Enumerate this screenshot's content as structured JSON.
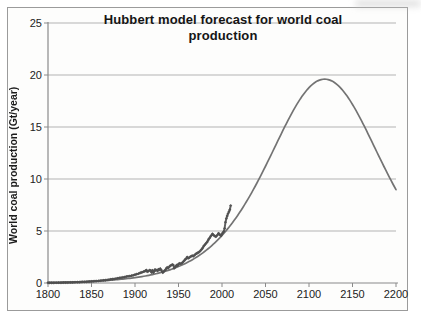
{
  "chart_data": {
    "type": "line",
    "title": "Hubbert model forecast for world coal production",
    "ylabel": "World coal production (Gt/year)",
    "xlabel": "",
    "xlim": [
      1800,
      2200
    ],
    "ylim": [
      0,
      25
    ],
    "x_ticks": [
      1800,
      1850,
      1900,
      1950,
      2000,
      2050,
      2100,
      2150,
      2200
    ],
    "y_ticks": [
      0,
      5,
      10,
      15,
      20,
      25
    ],
    "grid": "horizontal",
    "legend": "none",
    "colors": {
      "model_curve": "#6b6b6b",
      "historical_data": "#565656",
      "historical_marker": "#4e4e4e",
      "gridline": "#b3b3b3",
      "axis": "#8a8a8a",
      "text": "#1b1b1b",
      "frame_border": "#9b9b9b",
      "background": "#fdfdfc"
    },
    "series": [
      {
        "name": "Hubbert model forecast",
        "type": "smooth-line",
        "color_key": "model_curve",
        "model_params": {
          "formula": "P(t) = Pmax / cosh^2((t - peak_year) / width_years)",
          "Pmax_gt_per_year": 19.6,
          "peak_year": 2118,
          "width_years": 87
        },
        "sampled_points": [
          [
            1800,
            0.05
          ],
          [
            1810,
            0.07
          ],
          [
            1820,
            0.08
          ],
          [
            1830,
            0.1
          ],
          [
            1840,
            0.13
          ],
          [
            1850,
            0.17
          ],
          [
            1860,
            0.21
          ],
          [
            1870,
            0.26
          ],
          [
            1880,
            0.33
          ],
          [
            1890,
            0.41
          ],
          [
            1900,
            0.52
          ],
          [
            1910,
            0.65
          ],
          [
            1920,
            0.81
          ],
          [
            1930,
            1.01
          ],
          [
            1940,
            1.27
          ],
          [
            1950,
            1.58
          ],
          [
            1960,
            1.97
          ],
          [
            1970,
            2.45
          ],
          [
            1980,
            3.03
          ],
          [
            1990,
            3.73
          ],
          [
            2000,
            4.58
          ],
          [
            2010,
            5.58
          ],
          [
            2020,
            6.75
          ],
          [
            2030,
            8.09
          ],
          [
            2040,
            9.59
          ],
          [
            2050,
            11.23
          ],
          [
            2060,
            12.94
          ],
          [
            2070,
            14.66
          ],
          [
            2080,
            16.29
          ],
          [
            2090,
            17.7
          ],
          [
            2100,
            18.78
          ],
          [
            2110,
            19.43
          ],
          [
            2118,
            19.6
          ],
          [
            2130,
            19.23
          ],
          [
            2140,
            18.39
          ],
          [
            2150,
            17.17
          ],
          [
            2160,
            15.66
          ],
          [
            2170,
            13.98
          ],
          [
            2180,
            12.26
          ],
          [
            2190,
            10.57
          ],
          [
            2200,
            8.99
          ]
        ]
      },
      {
        "name": "Historical world coal production",
        "type": "line-with-markers",
        "marker": "diamond",
        "color_key": "historical_data",
        "points": [
          [
            1800,
            0.015
          ],
          [
            1802,
            0.017
          ],
          [
            1804,
            0.019
          ],
          [
            1806,
            0.021
          ],
          [
            1808,
            0.023
          ],
          [
            1810,
            0.026
          ],
          [
            1812,
            0.028
          ],
          [
            1814,
            0.031
          ],
          [
            1816,
            0.034
          ],
          [
            1818,
            0.037
          ],
          [
            1820,
            0.041
          ],
          [
            1822,
            0.045
          ],
          [
            1824,
            0.049
          ],
          [
            1826,
            0.054
          ],
          [
            1828,
            0.059
          ],
          [
            1830,
            0.064
          ],
          [
            1832,
            0.07
          ],
          [
            1834,
            0.077
          ],
          [
            1836,
            0.084
          ],
          [
            1838,
            0.091
          ],
          [
            1840,
            0.099
          ],
          [
            1842,
            0.107
          ],
          [
            1844,
            0.116
          ],
          [
            1846,
            0.126
          ],
          [
            1848,
            0.136
          ],
          [
            1850,
            0.147
          ],
          [
            1852,
            0.16
          ],
          [
            1854,
            0.173
          ],
          [
            1856,
            0.187
          ],
          [
            1858,
            0.202
          ],
          [
            1860,
            0.22
          ],
          [
            1862,
            0.238
          ],
          [
            1864,
            0.256
          ],
          [
            1866,
            0.275
          ],
          [
            1868,
            0.295
          ],
          [
            1870,
            0.32
          ],
          [
            1872,
            0.35
          ],
          [
            1874,
            0.375
          ],
          [
            1876,
            0.395
          ],
          [
            1878,
            0.42
          ],
          [
            1880,
            0.455
          ],
          [
            1882,
            0.49
          ],
          [
            1884,
            0.515
          ],
          [
            1886,
            0.54
          ],
          [
            1888,
            0.575
          ],
          [
            1890,
            0.615
          ],
          [
            1892,
            0.64
          ],
          [
            1894,
            0.665
          ],
          [
            1896,
            0.7
          ],
          [
            1898,
            0.745
          ],
          [
            1900,
            0.8
          ],
          [
            1902,
            0.85
          ],
          [
            1904,
            0.9
          ],
          [
            1906,
            0.98
          ],
          [
            1908,
            1.03
          ],
          [
            1910,
            1.1
          ],
          [
            1911,
            1.13
          ],
          [
            1912,
            1.17
          ],
          [
            1913,
            1.25
          ],
          [
            1914,
            1.1
          ],
          [
            1915,
            1.12
          ],
          [
            1916,
            1.18
          ],
          [
            1917,
            1.23
          ],
          [
            1918,
            1.2
          ],
          [
            1919,
            1.02
          ],
          [
            1920,
            1.22
          ],
          [
            1921,
            1.0
          ],
          [
            1922,
            1.12
          ],
          [
            1923,
            1.3
          ],
          [
            1924,
            1.22
          ],
          [
            1925,
            1.24
          ],
          [
            1926,
            1.17
          ],
          [
            1927,
            1.32
          ],
          [
            1928,
            1.27
          ],
          [
            1929,
            1.38
          ],
          [
            1930,
            1.27
          ],
          [
            1931,
            1.12
          ],
          [
            1932,
            1.0
          ],
          [
            1933,
            1.08
          ],
          [
            1934,
            1.2
          ],
          [
            1935,
            1.26
          ],
          [
            1936,
            1.42
          ],
          [
            1937,
            1.5
          ],
          [
            1938,
            1.43
          ],
          [
            1939,
            1.52
          ],
          [
            1940,
            1.62
          ],
          [
            1941,
            1.68
          ],
          [
            1942,
            1.73
          ],
          [
            1943,
            1.78
          ],
          [
            1944,
            1.72
          ],
          [
            1945,
            1.42
          ],
          [
            1946,
            1.5
          ],
          [
            1947,
            1.62
          ],
          [
            1948,
            1.72
          ],
          [
            1949,
            1.66
          ],
          [
            1950,
            1.82
          ],
          [
            1951,
            1.88
          ],
          [
            1952,
            1.85
          ],
          [
            1953,
            1.88
          ],
          [
            1954,
            1.92
          ],
          [
            1955,
            2.0
          ],
          [
            1956,
            2.1
          ],
          [
            1957,
            2.18
          ],
          [
            1958,
            2.3
          ],
          [
            1959,
            2.35
          ],
          [
            1960,
            2.5
          ],
          [
            1961,
            2.38
          ],
          [
            1962,
            2.42
          ],
          [
            1963,
            2.48
          ],
          [
            1964,
            2.55
          ],
          [
            1965,
            2.58
          ],
          [
            1966,
            2.62
          ],
          [
            1967,
            2.58
          ],
          [
            1968,
            2.65
          ],
          [
            1969,
            2.72
          ],
          [
            1970,
            2.8
          ],
          [
            1971,
            2.85
          ],
          [
            1972,
            2.9
          ],
          [
            1973,
            2.95
          ],
          [
            1974,
            3.0
          ],
          [
            1975,
            3.08
          ],
          [
            1976,
            3.18
          ],
          [
            1977,
            3.28
          ],
          [
            1978,
            3.4
          ],
          [
            1979,
            3.55
          ],
          [
            1980,
            3.65
          ],
          [
            1981,
            3.75
          ],
          [
            1982,
            3.85
          ],
          [
            1983,
            3.95
          ],
          [
            1984,
            4.1
          ],
          [
            1985,
            4.25
          ],
          [
            1986,
            4.35
          ],
          [
            1987,
            4.5
          ],
          [
            1988,
            4.6
          ],
          [
            1989,
            4.72
          ],
          [
            1990,
            4.65
          ],
          [
            1991,
            4.55
          ],
          [
            1992,
            4.5
          ],
          [
            1993,
            4.45
          ],
          [
            1994,
            4.55
          ],
          [
            1995,
            4.65
          ],
          [
            1996,
            4.78
          ],
          [
            1997,
            4.7
          ],
          [
            1998,
            4.6
          ],
          [
            1999,
            4.55
          ],
          [
            2000,
            4.7
          ],
          [
            2001,
            4.85
          ],
          [
            2002,
            4.95
          ],
          [
            2003,
            5.25
          ],
          [
            2004,
            5.85
          ],
          [
            2005,
            6.2
          ],
          [
            2006,
            6.45
          ],
          [
            2007,
            6.7
          ],
          [
            2008,
            6.85
          ],
          [
            2009,
            7.05
          ],
          [
            2010,
            7.45
          ]
        ]
      }
    ]
  }
}
